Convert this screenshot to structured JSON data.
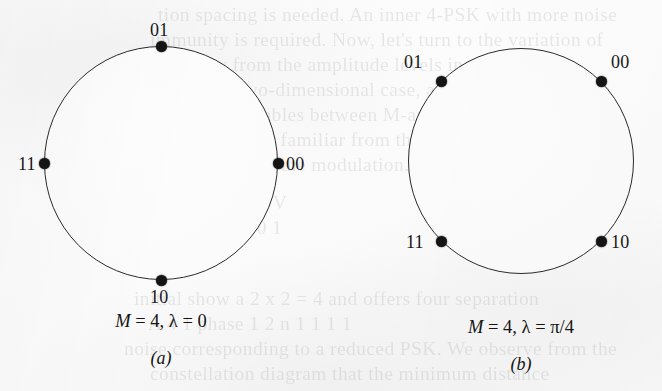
{
  "figure": {
    "kind": "psk-constellation-diagram",
    "background_color": "#fcfcfc",
    "ink_color": "#141414"
  },
  "chart_data": {
    "type": "scatter",
    "title": "",
    "subtitles": [
      "M = 4, λ = 0",
      "M = 4, λ = π/4"
    ],
    "panels": [
      {
        "id": "a",
        "label": "(a)",
        "caption_prefix": "M",
        "caption_rest": " = 4, λ = 0",
        "caption_text": "M = 4, λ = 0",
        "M": 4,
        "lambda_text": "0",
        "lambda_value": 0,
        "circle": {
          "cx": 161,
          "cy": 163,
          "r": 117
        },
        "points": [
          {
            "label": "00",
            "angle_deg": 0,
            "x": 278,
            "y": 163,
            "label_x": 286,
            "label_y": 155
          },
          {
            "label": "01",
            "angle_deg": 90,
            "x": 161,
            "y": 46,
            "label_x": 150,
            "label_y": 21
          },
          {
            "label": "11",
            "angle_deg": 180,
            "x": 44,
            "y": 163,
            "label_x": 18,
            "label_y": 155
          },
          {
            "label": "10",
            "angle_deg": 270,
            "x": 161,
            "y": 280,
            "label_x": 150,
            "label_y": 288
          }
        ]
      },
      {
        "id": "b",
        "label": "(b)",
        "caption_prefix": "M",
        "caption_rest": " = 4, λ = π/4",
        "caption_text": "M = 4, λ = π/4",
        "M": 4,
        "lambda_text": "π/4",
        "lambda_value": 0.7853981634,
        "circle": {
          "cx": 521,
          "cy": 161,
          "r": 113
        },
        "points": [
          {
            "label": "00",
            "angle_deg": 45,
            "x": 601,
            "y": 81,
            "label_x": 611,
            "label_y": 53
          },
          {
            "label": "01",
            "angle_deg": 135,
            "x": 441,
            "y": 81,
            "label_x": 404,
            "label_y": 53
          },
          {
            "label": "11",
            "angle_deg": 225,
            "x": 441,
            "y": 241,
            "label_x": 406,
            "label_y": 233
          },
          {
            "label": "10",
            "angle_deg": 315,
            "x": 601,
            "y": 241,
            "label_x": 611,
            "label_y": 233
          }
        ]
      }
    ],
    "axes": {
      "shown": false
    },
    "grid": false,
    "legend": {
      "shown": false
    }
  },
  "bleed_through": {
    "note": "faint mirrored text showing through from the reverse side of the page",
    "lines": [
      {
        "text": "tion spacing is needed. An inner 4-PSK with more noise",
        "x": 158,
        "y": 2
      },
      {
        "text": "immunity is required. Now, let's turn to the variation of",
        "x": 150,
        "y": 27
      },
      {
        "text": "energy from the amplitude levels in the constel-",
        "x": 172,
        "y": 52
      },
      {
        "text": "lation. In the two-dimensional case, all the elements are on",
        "x": 128,
        "y": 77
      },
      {
        "text": "the signal variables between M-ary constellations",
        "x": 146,
        "y": 102
      },
      {
        "text": "vectors. They are familiar from the parameters A. The",
        "x": 134,
        "y": 127
      },
      {
        "text": "M-1 terms of the modulation.",
        "x": 168,
        "y": 152
      },
      {
        "text": "a     4      b       2      n      1    1  1    1   1  V",
        "x": 120,
        "y": 190
      },
      {
        "text": "s     1      d       2      n      0    0  0    0   0  1",
        "x": 120,
        "y": 215
      },
      {
        "text": "initial show a 2 x 2 = 4 and offers four separation",
        "x": 134,
        "y": 286
      },
      {
        "text": "A        4 1 phase 1   2 n       1 1 1 1",
        "x": 148,
        "y": 311
      },
      {
        "text": "noise corresponding to a reduced PSK. We observe from the",
        "x": 124,
        "y": 336
      },
      {
        "text": "constellation diagram that the minimum distance",
        "x": 150,
        "y": 361
      }
    ]
  }
}
